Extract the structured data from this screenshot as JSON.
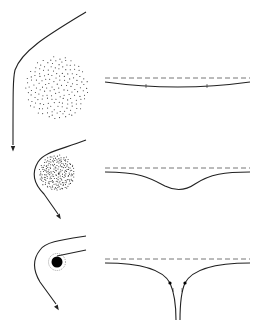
{
  "diagram": {
    "colors": {
      "line": "#222222",
      "dots": "#333333",
      "dashed": "#666666",
      "background": "#ffffff"
    },
    "panels": [
      {
        "id": "diffuse-cloud",
        "ray": "M 86 12 C 50 34, 22 50, 15 70 C 13 78, 13 90, 13 145",
        "arrow": {
          "x": 13,
          "y": 150,
          "angle": 90
        },
        "cloud": {
          "cx": 57,
          "cy": 88,
          "r": 32,
          "count": 170
        },
        "embedding": {
          "dashed_y": 78,
          "curve": "M 105 82 Q 178 92 250 82",
          "ticks": [
            {
              "x": 146,
              "y": 86
            },
            {
              "x": 207,
              "y": 86
            }
          ]
        }
      },
      {
        "id": "dense-cloud",
        "ray": "M 86 140 C 60 150, 44 152, 38 162 C 30 175, 36 186, 44 194 L 58 214",
        "arrow": {
          "x": 60,
          "y": 218,
          "angle": 58
        },
        "cloud": {
          "cx": 57,
          "cy": 173,
          "r": 18,
          "count": 210
        },
        "embedding": {
          "dashed_y": 168,
          "curve": "M 105 172 C 140 172, 150 178, 165 186 C 175 191, 185 191, 195 184 C 210 174, 225 172, 250 172"
        }
      },
      {
        "id": "black-hole",
        "ray": "M 86 236 C 60 240, 45 242, 40 250 C 32 260, 34 272, 40 282 L 56 304",
        "ray_inner": "M 86 250 L 57 256",
        "arrow": {
          "x": 58,
          "y": 309,
          "angle": 58
        },
        "hole": {
          "cx": 57,
          "cy": 262,
          "r": 5.5,
          "photon_sphere_r": 8.5
        },
        "embedding": {
          "dashed_y": 259,
          "curve_left": "M 105 263 C 140 263, 163 270, 170 283 C 174 292, 176 305, 176 320",
          "curve_right": "M 250 263 C 215 263, 192 270, 185 283 C 181 292, 180 305, 180 320",
          "dots": [
            {
              "x": 170,
              "y": 283
            },
            {
              "x": 185,
              "y": 283
            }
          ],
          "ticks": [
            {
              "x": 173,
              "y": 290
            },
            {
              "x": 182,
              "y": 290
            }
          ]
        }
      }
    ]
  }
}
